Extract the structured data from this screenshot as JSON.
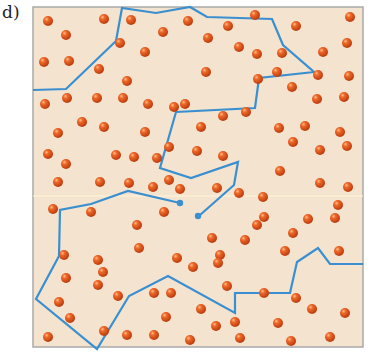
{
  "figure": {
    "label": "d)",
    "colors": {
      "background": "#f4e4cf",
      "border": "#a9a9a9",
      "particle": "#e2531c",
      "particle_highlight": "#ffb27a",
      "path": "#3a8fd0"
    }
  },
  "particles": [
    [
      48,
      21
    ],
    [
      104,
      19
    ],
    [
      131,
      20
    ],
    [
      66,
      35
    ],
    [
      44,
      62
    ],
    [
      69,
      61
    ],
    [
      120,
      43
    ],
    [
      99,
      69
    ],
    [
      127,
      81
    ],
    [
      145,
      52
    ],
    [
      163,
      32
    ],
    [
      188,
      21
    ],
    [
      255,
      15
    ],
    [
      228,
      26
    ],
    [
      208,
      38
    ],
    [
      239,
      47
    ],
    [
      206,
      72
    ],
    [
      296,
      26
    ],
    [
      282,
      53
    ],
    [
      350,
      17
    ],
    [
      347,
      43
    ],
    [
      323,
      52
    ],
    [
      277,
      72
    ],
    [
      257,
      54
    ],
    [
      318,
      75
    ],
    [
      349,
      76
    ],
    [
      45,
      104
    ],
    [
      67,
      98
    ],
    [
      97,
      98
    ],
    [
      123,
      98
    ],
    [
      148,
      104
    ],
    [
      174,
      107
    ],
    [
      82,
      122
    ],
    [
      58,
      133
    ],
    [
      104,
      127
    ],
    [
      145,
      132
    ],
    [
      48,
      154
    ],
    [
      66,
      164
    ],
    [
      116,
      155
    ],
    [
      134,
      157
    ],
    [
      153,
      187
    ],
    [
      201,
      127
    ],
    [
      185,
      104
    ],
    [
      223,
      116
    ],
    [
      246,
      112
    ],
    [
      258,
      79
    ],
    [
      292,
      87
    ],
    [
      317,
      99
    ],
    [
      344,
      97
    ],
    [
      279,
      128
    ],
    [
      305,
      126
    ],
    [
      340,
      132
    ],
    [
      197,
      151
    ],
    [
      169,
      147
    ],
    [
      223,
      156
    ],
    [
      293,
      142
    ],
    [
      320,
      150
    ],
    [
      347,
      146
    ],
    [
      58,
      182
    ],
    [
      100,
      182
    ],
    [
      129,
      183
    ],
    [
      157,
      158
    ],
    [
      180,
      189
    ],
    [
      217,
      188
    ],
    [
      239,
      193
    ],
    [
      280,
      171
    ],
    [
      263,
      197
    ],
    [
      320,
      183
    ],
    [
      348,
      187
    ],
    [
      53,
      209
    ],
    [
      91,
      212
    ],
    [
      169,
      180
    ],
    [
      220,
      255
    ],
    [
      257,
      225
    ],
    [
      308,
      219
    ],
    [
      338,
      205
    ],
    [
      212,
      238
    ],
    [
      264,
      217
    ],
    [
      293,
      233
    ],
    [
      335,
      218
    ],
    [
      64,
      255
    ],
    [
      103,
      272
    ],
    [
      139,
      248
    ],
    [
      164,
      212
    ],
    [
      177,
      258
    ],
    [
      218,
      263
    ],
    [
      285,
      251
    ],
    [
      339,
      251
    ],
    [
      66,
      278
    ],
    [
      98,
      285
    ],
    [
      154,
      293
    ],
    [
      154,
      335
    ],
    [
      166,
      317
    ],
    [
      193,
      267
    ],
    [
      227,
      286
    ],
    [
      216,
      326
    ],
    [
      240,
      338
    ],
    [
      264,
      293
    ],
    [
      296,
      298
    ],
    [
      278,
      323
    ],
    [
      312,
      309
    ],
    [
      345,
      313
    ],
    [
      330,
      337
    ],
    [
      291,
      341
    ],
    [
      190,
      340
    ],
    [
      235,
      322
    ],
    [
      118,
      296
    ],
    [
      104,
      331
    ],
    [
      48,
      337
    ],
    [
      98,
      260
    ],
    [
      70,
      318
    ],
    [
      59,
      302
    ],
    [
      127,
      335
    ],
    [
      201,
      309
    ],
    [
      171,
      293
    ],
    [
      245,
      240
    ],
    [
      137,
      225
    ]
  ],
  "paths": [
    {
      "name": "upper-chain",
      "points": [
        [
          33,
          90
        ],
        [
          66,
          90
        ],
        [
          116,
          42
        ],
        [
          122,
          8
        ],
        [
          156,
          14
        ],
        [
          190,
          8
        ],
        [
          207,
          18
        ],
        [
          272,
          19
        ],
        [
          284,
          44
        ],
        [
          315,
          72
        ],
        [
          260,
          78
        ],
        [
          254,
          108
        ],
        [
          176,
          112
        ],
        [
          160,
          167
        ],
        [
          180,
          205
        ]
      ]
    },
    {
      "name": "lower-chain",
      "points": [
        [
          197,
          217
        ],
        [
          238,
          190
        ],
        [
          237,
          178
        ],
        [
          234,
          162
        ],
        [
          228,
          164
        ],
        [
          230,
          186
        ],
        [
          197,
          217
        ]
      ]
    },
    {
      "name": "lower-loop",
      "points": [
        [
          180,
          204
        ],
        [
          128,
          191
        ],
        [
          92,
          197
        ],
        [
          60,
          211
        ],
        [
          60,
          256
        ],
        [
          36,
          300
        ],
        [
          97,
          350
        ],
        [
          130,
          298
        ],
        [
          168,
          277
        ],
        [
          236,
          315
        ],
        [
          236,
          293
        ],
        [
          291,
          294
        ],
        [
          298,
          262
        ],
        [
          318,
          248
        ],
        [
          328,
          265
        ],
        [
          363,
          265
        ]
      ]
    }
  ]
}
